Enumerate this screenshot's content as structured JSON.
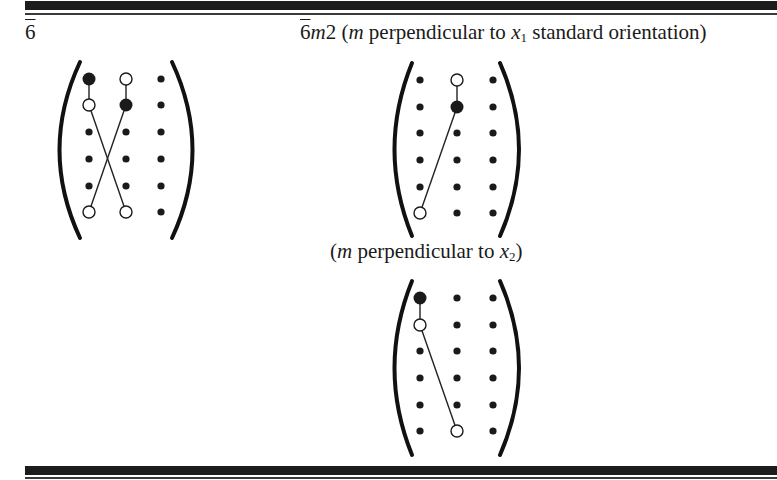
{
  "rules": {
    "top_thick_y": 1,
    "top_thin_y": 13,
    "bottom_thick_y": 466,
    "bottom_thin_y": 477
  },
  "left_panel": {
    "label_base": "6",
    "label_bar": true,
    "matrix": {
      "cols_x": [
        89,
        126,
        161
      ],
      "rows_y": [
        79,
        105,
        132,
        159,
        186,
        212
      ],
      "bracket_left": {
        "x_top": 80,
        "x_mid": 47,
        "x_bot": 80,
        "y_top": 62,
        "y_bot": 238
      },
      "bracket_right": {
        "x_top": 172,
        "x_mid": 205,
        "x_bot": 172,
        "y_top": 62,
        "y_bot": 238
      },
      "big_filled": [
        [
          0,
          0
        ],
        [
          1,
          1
        ]
      ],
      "open": [
        [
          0,
          1
        ],
        [
          1,
          0
        ],
        [
          5,
          0
        ],
        [
          5,
          1
        ]
      ],
      "lines": [
        [
          [
            0,
            0
          ],
          [
            1,
            0
          ]
        ],
        [
          [
            1,
            0
          ],
          [
            5,
            1
          ]
        ],
        [
          [
            0,
            1
          ],
          [
            1,
            1
          ]
        ],
        [
          [
            1,
            1
          ],
          [
            5,
            0
          ]
        ]
      ]
    }
  },
  "upper_right_panel": {
    "label_base": "6",
    "label_m": "m",
    "label_2": "2",
    "label_paren_open": " (",
    "label_m2": "m",
    "label_rest": " perpendicular to ",
    "label_x": "x",
    "label_sub": "1",
    "label_tail": " standard orientation)",
    "matrix": {
      "cols_x": [
        420,
        457,
        493
      ],
      "rows_y": [
        80,
        107,
        133,
        160,
        187,
        213
      ],
      "bracket_left": {
        "x_top": 412,
        "x_mid": 385,
        "x_bot": 412,
        "y_top": 63,
        "y_bot": 236
      },
      "bracket_right": {
        "x_top": 500,
        "x_mid": 530,
        "x_bot": 500,
        "y_top": 63,
        "y_bot": 236
      },
      "big_filled": [
        [
          1,
          1
        ]
      ],
      "open": [
        [
          0,
          1
        ],
        [
          5,
          0
        ]
      ],
      "lines": [
        [
          [
            0,
            1
          ],
          [
            1,
            1
          ]
        ],
        [
          [
            1,
            1
          ],
          [
            5,
            0
          ]
        ]
      ]
    }
  },
  "lower_right_panel": {
    "label_open": "(",
    "label_m": "m",
    "label_rest": " perpendicular to ",
    "label_x": "x",
    "label_sub": "2",
    "label_close": ")",
    "matrix": {
      "cols_x": [
        420,
        457,
        493
      ],
      "rows_y": [
        298,
        325,
        351,
        378,
        405,
        431
      ],
      "bracket_left": {
        "x_top": 412,
        "x_mid": 385,
        "x_bot": 412,
        "y_top": 281,
        "y_bot": 455
      },
      "bracket_right": {
        "x_top": 500,
        "x_mid": 530,
        "x_bot": 500,
        "y_top": 281,
        "y_bot": 455
      },
      "big_filled": [
        [
          0,
          0
        ]
      ],
      "open": [
        [
          1,
          0
        ],
        [
          5,
          1
        ]
      ],
      "lines": [
        [
          [
            0,
            0
          ],
          [
            1,
            0
          ]
        ],
        [
          [
            1,
            0
          ],
          [
            5,
            1
          ]
        ]
      ]
    }
  }
}
